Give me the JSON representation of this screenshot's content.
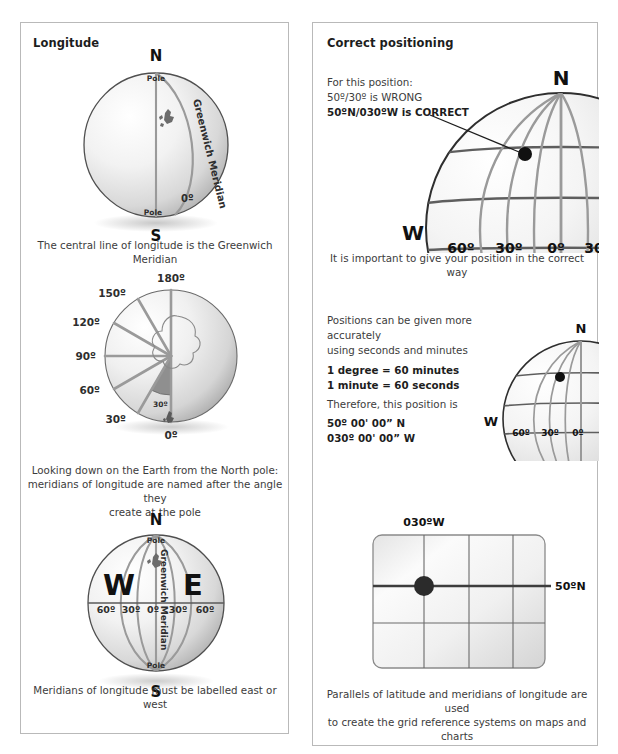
{
  "left_panel": {
    "title": "Longitude",
    "fig1": {
      "north_label": "N",
      "south_label": "S",
      "north_pole_label": "Pole",
      "south_pole_label": "Pole",
      "meridian_label": "Greenwich Meridian",
      "zero_label": "0º",
      "caption": "The central line of longitude is the Greenwich Meridian"
    },
    "fig2": {
      "tick_labels": [
        "0º",
        "30º",
        "60º",
        "90º",
        "120º",
        "150º",
        "180º"
      ],
      "angle_label": "30º",
      "caption": "Looking down on the Earth from the North pole:\nmeridians of longitude are named after the angle they\ncreate at the pole"
    },
    "fig3": {
      "north_label": "N",
      "south_label": "S",
      "north_pole_label": "Pole",
      "south_pole_label": "Pole",
      "west_label": "W",
      "east_label": "E",
      "meridian_label": "Greenwich Meridian",
      "equator_ticks": [
        "60º",
        "30º",
        "0º",
        "30º",
        "60º"
      ],
      "caption": "Meridians of longitude must be labelled east or west"
    }
  },
  "right_panel": {
    "title": "Correct positioning",
    "fig1": {
      "callout_line1": "For this position:",
      "callout_line2": "50º/30º is WRONG",
      "callout_line3": "50ºN/030ºW is CORRECT",
      "north_label": "N",
      "west_label": "W",
      "tick_labels": [
        "60º",
        "30º",
        "0º",
        "30º"
      ],
      "caption": "It is important to give your position in the correct way"
    },
    "fig2": {
      "text_line1": "Positions can be given more accurately",
      "text_line2": "using seconds and minutes",
      "bold_line1": "1 degree = 60 minutes",
      "bold_line2": "1 minute = 60 seconds",
      "text_line3": "Therefore, this position is",
      "bold_line3": "50º 00' 00” N",
      "bold_line4": "030º 00' 00” W",
      "north_label": "N",
      "west_label": "W",
      "tick_labels": [
        "60º",
        "30º",
        "0º"
      ]
    },
    "fig3": {
      "top_label": "030ºW",
      "right_label": "50ºN",
      "caption": "Parallels of latitude and meridians of longitude are used\nto create the grid reference systems on maps and charts"
    }
  },
  "colors": {
    "panel_border": "#b9b9b9",
    "text": "#3c3c3c",
    "heading": "#1d1d1d",
    "grid_line": "#8d8d8d",
    "dark_line": "#4a4a4a",
    "dot": "#1a1a1a",
    "globe_edge": "#4f4f4f"
  }
}
